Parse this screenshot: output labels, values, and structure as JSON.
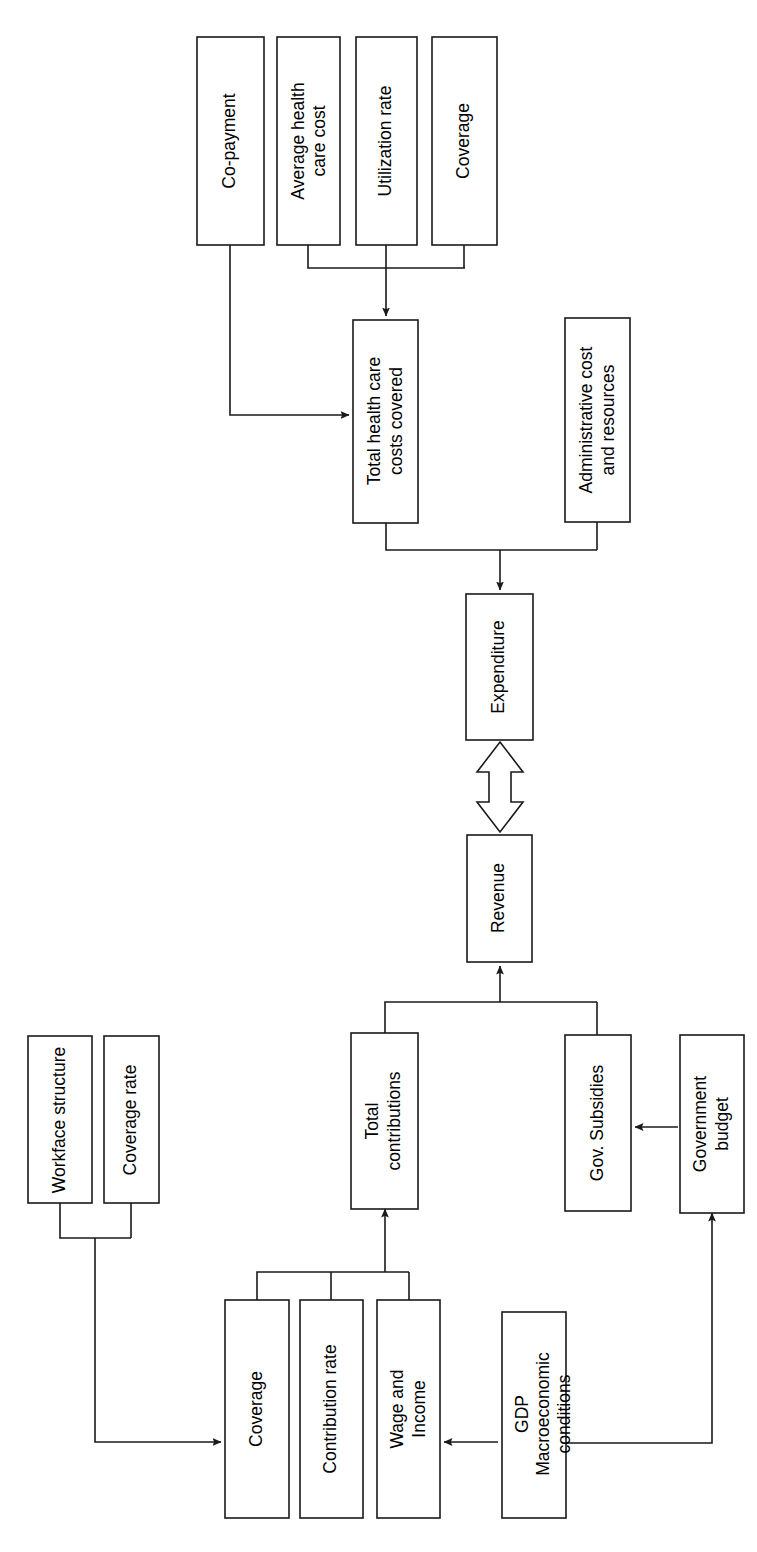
{
  "diagram": {
    "orientation": "rotated-90-counterclockwise",
    "background_color": "#ffffff",
    "line_color": "#1a1a1a",
    "box_fill": "#ffffff",
    "nodes": {
      "co_payment": {
        "label": "Co-payment"
      },
      "average_health_care_cost": {
        "line1": "Average health",
        "line2": "care cost"
      },
      "utilization_rate": {
        "label": "Utilization rate"
      },
      "coverage_top": {
        "label": "Coverage"
      },
      "total_health_care_costs_covered": {
        "line1": "Total health care",
        "line2": "costs covered"
      },
      "administrative_cost_and_resources": {
        "line1": "Administrative cost",
        "line2": "and resources"
      },
      "expenditure": {
        "label": "Expenditure"
      },
      "revenue": {
        "label": "Revenue"
      },
      "total_contributions": {
        "line1": "Total",
        "line2": "contributions"
      },
      "gov_subsidies": {
        "label": "Gov. Subsidies"
      },
      "government_budget": {
        "line1": "Government",
        "line2": "budget"
      },
      "workface_structure": {
        "label": "Workface structure"
      },
      "coverage_rate": {
        "label": "Coverage rate"
      },
      "coverage_bottom": {
        "label": "Coverage"
      },
      "contribution_rate": {
        "label": "Contribution rate"
      },
      "wage_and_income": {
        "line1": "Wage and",
        "line2": "Income"
      },
      "gdp_macroeconomic_conditions": {
        "line1": "GDP",
        "line2": "Macroeconomic",
        "line3": "conditions"
      }
    },
    "edges": [
      {
        "from": "co-payment",
        "to": "total-health-care-costs-covered",
        "arrow": "single"
      },
      {
        "from": "average-health-care-cost",
        "to": "total-health-care-costs-covered",
        "arrow": "single"
      },
      {
        "from": "utilization-rate",
        "to": "total-health-care-costs-covered",
        "arrow": "single"
      },
      {
        "from": "coverage-top",
        "to": "total-health-care-costs-covered",
        "arrow": "single"
      },
      {
        "from": "total-health-care-costs-covered",
        "to": "expenditure",
        "arrow": "single"
      },
      {
        "from": "administrative-cost-and-resources",
        "to": "expenditure",
        "arrow": "single"
      },
      {
        "from": "expenditure",
        "to": "revenue",
        "arrow": "double-hollow"
      },
      {
        "from": "total-contributions",
        "to": "revenue",
        "arrow": "single"
      },
      {
        "from": "gov-subsidies",
        "to": "revenue",
        "arrow": "single"
      },
      {
        "from": "government-budget",
        "to": "gov-subsidies",
        "arrow": "single"
      },
      {
        "from": "workface-structure",
        "to": "coverage-bottom",
        "arrow": "single"
      },
      {
        "from": "coverage-rate",
        "to": "coverage-bottom",
        "arrow": "single"
      },
      {
        "from": "coverage-bottom",
        "to": "total-contributions",
        "arrow": "single"
      },
      {
        "from": "contribution-rate",
        "to": "total-contributions",
        "arrow": "single"
      },
      {
        "from": "wage-and-income",
        "to": "total-contributions",
        "arrow": "single"
      },
      {
        "from": "gdp-macroeconomic-conditions",
        "to": "wage-and-income",
        "arrow": "single"
      },
      {
        "from": "gdp-macroeconomic-conditions",
        "to": "government-budget",
        "arrow": "single"
      }
    ]
  }
}
